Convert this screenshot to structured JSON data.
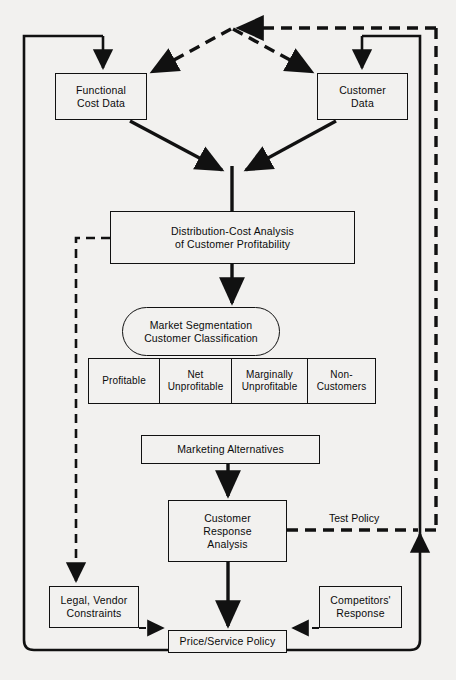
{
  "diagram": {
    "nodes": {
      "functional_cost_data": {
        "line1": "Functional",
        "line2": "Cost Data"
      },
      "customer_data": {
        "line1": "Customer",
        "line2": "Data"
      },
      "distribution_cost_analysis": {
        "line1": "Distribution-Cost Analysis",
        "line2": "of Customer  Profitability"
      },
      "market_segmentation": {
        "line1": "Market Segmentation",
        "line2": "Customer Classification"
      },
      "marketing_alternatives": {
        "line1": "Marketing Alternatives"
      },
      "customer_response_analysis": {
        "line1": "Customer",
        "line2": "Response",
        "line3": "Analysis"
      },
      "legal_vendor_constraints": {
        "line1": "Legal, Vendor",
        "line2": "Constraints"
      },
      "competitors_response": {
        "line1": "Competitors'",
        "line2": "Response"
      },
      "price_service_policy": {
        "line1": "Price/Service Policy"
      }
    },
    "classification_cells": [
      {
        "line1": "Profitable",
        "line2": ""
      },
      {
        "line1": "Net",
        "line2": "Unprofitable"
      },
      {
        "line1": "Marginally",
        "line2": "Unprofitable"
      },
      {
        "line1": "Non-",
        "line2": "Customers"
      }
    ],
    "edge_labels": {
      "test_policy": "Test Policy"
    },
    "colors": {
      "ink": "#111111",
      "paper": "#f2f1ef"
    }
  }
}
